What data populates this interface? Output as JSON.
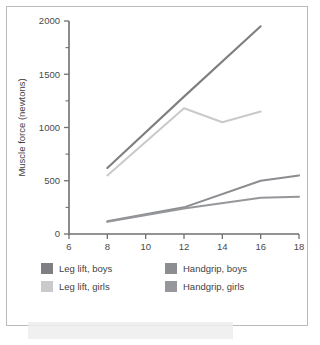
{
  "chart_data": {
    "type": "line",
    "title": "",
    "xlabel": "Age (years)",
    "ylabel": "Muscle force (newtons)",
    "xlim": [
      6,
      18
    ],
    "ylim": [
      0,
      2000
    ],
    "xticks": [
      6,
      8,
      10,
      12,
      14,
      16,
      18
    ],
    "yticks": [
      0,
      500,
      1000,
      1500,
      2000
    ],
    "yticks_minor": [
      250,
      750,
      1250,
      1750
    ],
    "grid": false,
    "legend_position": "bottom",
    "series": [
      {
        "name": "Leg lift, boys",
        "color": "#7d7f82",
        "x": [
          8,
          12,
          16
        ],
        "values": [
          620,
          1290,
          1950
        ]
      },
      {
        "name": "Leg lift, girls",
        "color": "#c8cacb",
        "x": [
          8,
          12,
          14,
          16
        ],
        "values": [
          550,
          1180,
          1050,
          1150
        ]
      },
      {
        "name": "Handgrip, boys",
        "color": "#8b8d90",
        "x": [
          8,
          12,
          16,
          18
        ],
        "values": [
          120,
          250,
          500,
          550
        ]
      },
      {
        "name": "Handgrip, girls",
        "color": "#95979a",
        "x": [
          8,
          12,
          16,
          18
        ],
        "values": [
          115,
          240,
          340,
          350
        ]
      }
    ]
  },
  "legend": {
    "items": [
      {
        "label": "Leg lift, boys",
        "color": "#7d7f82"
      },
      {
        "label": "Handgrip, boys",
        "color": "#8b8d90"
      },
      {
        "label": "Leg lift, girls",
        "color": "#c8cacb"
      },
      {
        "label": "Handgrip, girls",
        "color": "#95979a"
      }
    ]
  },
  "axes": {
    "x_title": "Age (years)",
    "y_title": "Muscle force (newtons)",
    "x_tick_labels": [
      "6",
      "8",
      "10",
      "12",
      "14",
      "16",
      "18"
    ],
    "y_tick_labels": [
      "0",
      "500",
      "1000",
      "1500",
      "2000"
    ]
  }
}
